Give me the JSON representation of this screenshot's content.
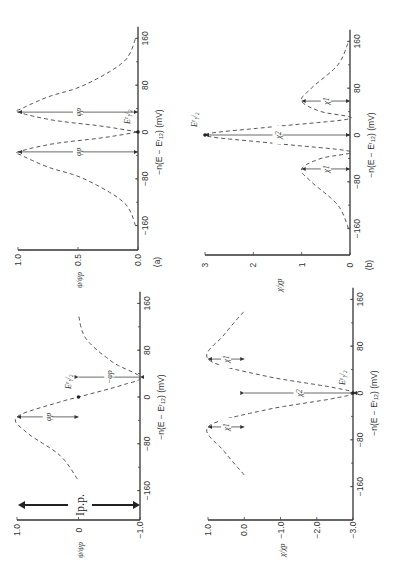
{
  "figure": {
    "orientation": "rotated 90 degrees counter-clockwise",
    "panel_labels": [
      "(a)",
      "(b)"
    ]
  },
  "chart_data": [
    {
      "id": "a-top",
      "type": "line",
      "title": "",
      "panel": "(a)",
      "xlabel": "-n(E - E^r_1/2) (mV)",
      "ylabel": "ψ/ψp",
      "x_ticks": [
        "-160",
        "-80",
        "0",
        "80",
        "160"
      ],
      "y_ticks": [
        "0.0",
        "0.5",
        "1.0"
      ],
      "xlim": [
        -180,
        180
      ],
      "ylim": [
        0,
        1.0
      ],
      "series": [
        {
          "name": "forward peak",
          "x": [
            -160,
            -120,
            -80,
            -60,
            -40,
            -34,
            -20,
            -10,
            0
          ],
          "y": [
            0.02,
            0.12,
            0.45,
            0.75,
            0.97,
            1.0,
            0.7,
            0.3,
            0.0
          ]
        },
        {
          "name": "reverse peak",
          "x": [
            0,
            10,
            20,
            34,
            40,
            60,
            80,
            120,
            160
          ],
          "y": [
            0.0,
            0.3,
            0.7,
            1.0,
            0.97,
            0.75,
            0.45,
            0.12,
            0.02
          ]
        }
      ],
      "annotations": [
        {
          "text": "ψp",
          "x": -34
        },
        {
          "text": "ψp",
          "x": 34
        },
        {
          "text": "E^r_1/2",
          "x": 0
        }
      ]
    },
    {
      "id": "b-top",
      "type": "line",
      "panel": "(b)",
      "xlabel": "-n(E - E^r_1/2) (mV)",
      "ylabel": "χ/χp",
      "x_ticks": [
        "-160",
        "-80",
        "0",
        "80",
        "160"
      ],
      "y_ticks": [
        "0",
        "1",
        "2",
        "3"
      ],
      "xlim": [
        -180,
        180
      ],
      "ylim": [
        0,
        3
      ],
      "series": [
        {
          "name": "curve",
          "x": [
            -160,
            -120,
            -80,
            -58,
            -40,
            -28,
            -14,
            0,
            14,
            28,
            40,
            58,
            80,
            120,
            160
          ],
          "y": [
            0.03,
            0.25,
            0.8,
            1.0,
            0.6,
            0.0,
            1.6,
            3.0,
            1.6,
            0.0,
            0.6,
            1.0,
            0.8,
            0.25,
            0.03
          ]
        }
      ],
      "annotations": [
        {
          "text": "χ1",
          "x": -58
        },
        {
          "text": "χ2",
          "x": 0
        },
        {
          "text": "χ1",
          "x": 58
        },
        {
          "text": "E^r_1/2",
          "x": 0
        }
      ]
    },
    {
      "id": "a-bottom",
      "type": "line",
      "panel": "(a)",
      "xlabel": "-n(E - E^r_1/2)(mV)",
      "ylabel": "ψ/ψp",
      "x_ticks": [
        "-160",
        "-80",
        "0",
        "80",
        "160"
      ],
      "y_ticks": [
        "-1.0",
        "0",
        "1.0"
      ],
      "xlim": [
        -180,
        180
      ],
      "ylim": [
        -1.0,
        1.0
      ],
      "series": [
        {
          "name": "net current",
          "x": [
            -140,
            -100,
            -60,
            -34,
            -10,
            0,
            20,
            34,
            60,
            100,
            140
          ],
          "y": [
            0.02,
            0.3,
            0.85,
            1.0,
            0.35,
            0.0,
            -0.7,
            -1.0,
            -0.55,
            -0.12,
            0.0
          ]
        }
      ],
      "annotations": [
        {
          "text": "ψp",
          "x": -34
        },
        {
          "text": "-ψp",
          "x": 34
        },
        {
          "text": "E^r_1/2",
          "x": 0
        },
        {
          "text": "Ip.p.",
          "x": -170
        }
      ]
    },
    {
      "id": "b-bottom",
      "type": "line",
      "panel": "(b)",
      "xlabel": "-n(E - E^r_1/2)(mV)",
      "ylabel": "χ/χp",
      "x_ticks": [
        "-160",
        "-80",
        "0",
        "80",
        "160"
      ],
      "y_ticks": [
        "-3.0",
        "-2.0",
        "-1.0",
        "0.0",
        "1.0"
      ],
      "xlim": [
        -180,
        180
      ],
      "ylim": [
        -3.0,
        1.0
      ],
      "series": [
        {
          "name": "curve",
          "x": [
            -140,
            -100,
            -58,
            -30,
            -10,
            0,
            10,
            30,
            58,
            100,
            140
          ],
          "y": [
            0.0,
            0.55,
            1.0,
            -0.5,
            -2.4,
            -3.0,
            -2.4,
            -0.5,
            1.0,
            0.55,
            0.0
          ]
        }
      ],
      "annotations": [
        {
          "text": "χ1",
          "x": -58
        },
        {
          "text": "χ2",
          "x": 0
        },
        {
          "text": "χ1",
          "x": 58
        },
        {
          "text": "E^r_1/2",
          "x": 0
        }
      ]
    }
  ],
  "labels": {
    "xlabel_a_top": "−n(E − E",
    "xlabel_suffix": ")(mV)",
    "panel_a": "(a)",
    "panel_b": "(b)",
    "ylabel_psi": "ψ/ψp",
    "ylabel_chi": "χ/χp",
    "ann_psip": "φp",
    "ann_neg_psip": "−φp",
    "ann_chi1": "χ1",
    "ann_chi2": "χ2",
    "ann_e": "E",
    "ann_ipp": "Ip.p."
  }
}
